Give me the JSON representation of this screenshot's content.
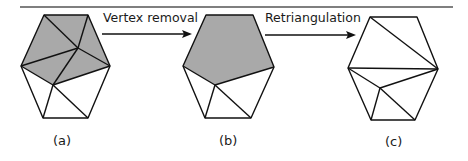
{
  "diagram": {
    "colors": {
      "stroke": "#111111",
      "fill_shaded": "#a9a9a9",
      "rule": "#555555",
      "background": "#ffffff"
    },
    "arrows": [
      {
        "id": "arrow-vertex-removal",
        "label": "Vertex removal",
        "from": "a",
        "to": "b"
      },
      {
        "id": "arrow-retriangulation",
        "label": "Retriangulation",
        "from": "b",
        "to": "c"
      }
    ],
    "panels": [
      {
        "id": "a",
        "label": "(a)",
        "description": "Hexagonal mesh with interior vertex; shaded triangles incident to vertex to be removed"
      },
      {
        "id": "b",
        "label": "(b)",
        "description": "Vertex removed leaving a shaded polygonal hole"
      },
      {
        "id": "c",
        "label": "(c)",
        "description": "Hole retriangulated"
      }
    ]
  }
}
